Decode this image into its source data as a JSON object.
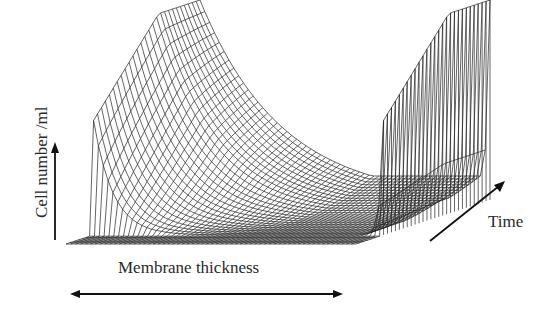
{
  "diagram": {
    "title": "",
    "type": "3d-wireframe-surface",
    "axes": {
      "y_label": "Cell number /ml",
      "x_label": "Membrane thickness",
      "t_label": "Time"
    },
    "arrows": {
      "y_arrow": "up",
      "x_arrow": "double-headed",
      "t_arrow": "diagonal-up-right"
    },
    "surface_description": "Cell number is high at both membrane boundaries (edges) and decays to a minimum in the interior; the interior trough deepens/widens over time, with a flat floor region near the front.",
    "colors": {
      "line": "#222222",
      "background": "#ffffff"
    }
  },
  "chart_data": {
    "type": "surface",
    "title": "",
    "xlabel": "Membrane thickness",
    "ylabel": "Cell number /ml",
    "zlabel": "Time",
    "grid": false,
    "legend": "none",
    "shape": {
      "x_profile": "high at x=0 and x=1 boundaries, exponential decay toward interior",
      "time_evolution": "at early time the surface is near zero except near boundaries; over time the interior level rises toward the boundary value, left boundary shows decay curve, right boundary sharp peak"
    }
  }
}
